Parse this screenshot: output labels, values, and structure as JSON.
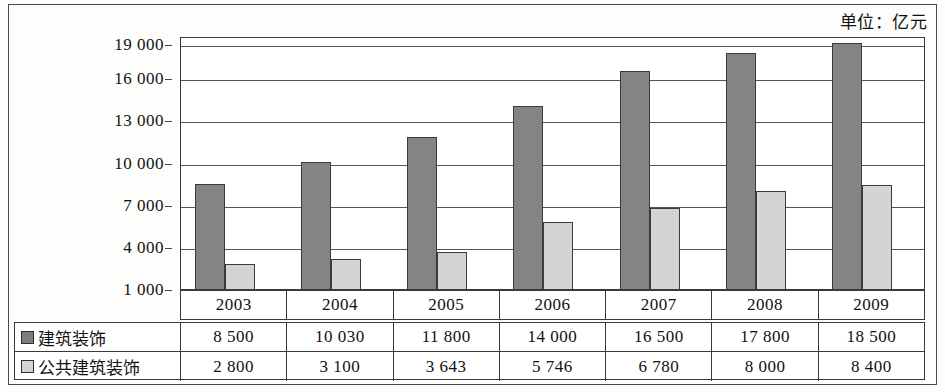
{
  "unit_caption": "单位：亿元",
  "chart_data": {
    "type": "bar",
    "title": "",
    "subtitle": "",
    "xlabel": "",
    "ylabel": "",
    "unit_note": "单位：亿元",
    "categories": [
      "2003",
      "2004",
      "2005",
      "2006",
      "2007",
      "2008",
      "2009"
    ],
    "series": [
      {
        "name": "建筑装饰",
        "color": "#848484",
        "values": [
          8500,
          10030,
          11800,
          14000,
          16500,
          17800,
          18500
        ]
      },
      {
        "name": "公共建筑装饰",
        "color": "#d4d4d4",
        "values": [
          2800,
          3100,
          3643,
          5746,
          6780,
          8000,
          8400
        ]
      }
    ],
    "ylim": [
      1000,
      19000
    ],
    "ytick_values": [
      19000,
      16000,
      13000,
      10000,
      7000,
      4000,
      1000
    ],
    "ytick_labels": [
      "19 000",
      "16 000",
      "13 000",
      "10 000",
      "7 000",
      "4 000",
      "1 000"
    ],
    "grid": true,
    "legend_position": "table-left-column",
    "baseline": 1000
  },
  "table": {
    "rows": [
      {
        "label": "建筑装饰",
        "swatch": "dark-square-swatch",
        "values": [
          "8 500",
          "10 030",
          "11 800",
          "14 000",
          "16 500",
          "17 800",
          "18 500"
        ]
      },
      {
        "label": "公共建筑装饰",
        "swatch": "light-square-swatch",
        "values": [
          "2 800",
          "3 100",
          "3 643",
          "5 746",
          "6 780",
          "8 000",
          "8 400"
        ]
      }
    ]
  },
  "colors": {
    "series_dark": "#848484",
    "series_light": "#d4d4d4",
    "border": "#3a3a3a",
    "background": "#ffffff"
  }
}
